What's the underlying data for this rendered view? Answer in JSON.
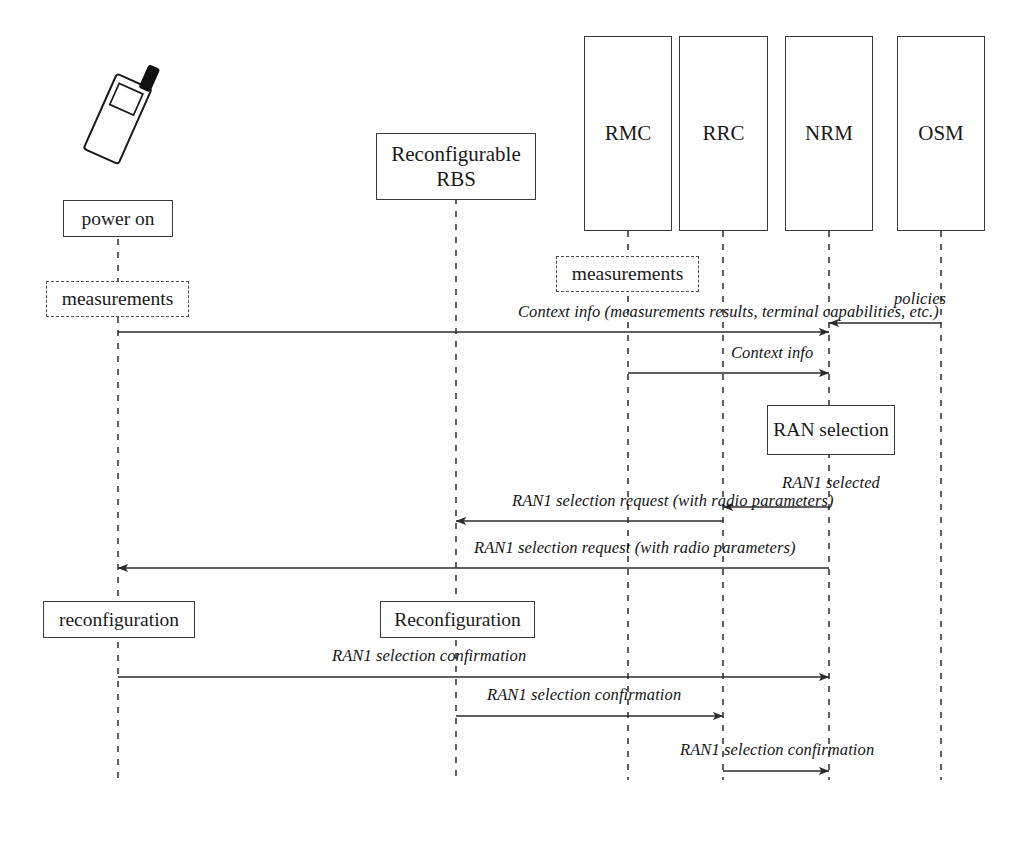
{
  "diagram": {
    "type": "uml-sequence-diagram",
    "title": "",
    "background_color": "#ffffff",
    "line_color": "#3a3a3a",
    "text_color": "#141414"
  },
  "actor_icon": {
    "name": "mobile-handset-icon",
    "label": ""
  },
  "lifelines": [
    {
      "id": "terminal",
      "label": "",
      "has_header_box": false,
      "x": 118,
      "top": 200,
      "bottom": 780
    },
    {
      "id": "rbs",
      "label": "Reconfigurable\nRBS",
      "has_header_box": true,
      "x": 456,
      "top": 133,
      "bottom": 780
    },
    {
      "id": "rmc",
      "label": "RMC",
      "has_header_box": true,
      "x": 628,
      "top": 36,
      "bottom": 780
    },
    {
      "id": "rrc",
      "label": "RRC",
      "has_header_box": true,
      "x": 723,
      "top": 36,
      "bottom": 780
    },
    {
      "id": "nrm",
      "label": "NRM",
      "has_header_box": true,
      "x": 829,
      "top": 36,
      "bottom": 780
    },
    {
      "id": "osm",
      "label": "OSM",
      "has_header_box": true,
      "x": 941,
      "top": 36,
      "bottom": 780
    }
  ],
  "actor_boxes": [
    {
      "id": "rbs-header",
      "line1": "Reconfigurable",
      "line2": "RBS",
      "x": 376,
      "y": 133,
      "w": 160,
      "h": 67
    },
    {
      "id": "rmc-header",
      "line1": "RMC",
      "line2": "",
      "x": 584,
      "y": 36,
      "w": 88,
      "h": 195
    },
    {
      "id": "rrc-header",
      "line1": "RRC",
      "line2": "",
      "x": 679,
      "y": 36,
      "w": 89,
      "h": 195
    },
    {
      "id": "nrm-header",
      "line1": "NRM",
      "line2": "",
      "x": 785,
      "y": 36,
      "w": 88,
      "h": 195
    },
    {
      "id": "osm-header",
      "line1": "OSM",
      "line2": "",
      "x": 897,
      "y": 36,
      "w": 88,
      "h": 195
    }
  ],
  "state_boxes": [
    {
      "id": "power-on",
      "label": "power on",
      "style": "solid",
      "x": 63,
      "y": 200,
      "w": 110,
      "h": 37
    },
    {
      "id": "measurements-term",
      "label": "measurements",
      "style": "dashed",
      "x": 46,
      "y": 281,
      "w": 143,
      "h": 36
    },
    {
      "id": "measurements-rmc",
      "label": "measurements",
      "style": "dashed",
      "x": 556,
      "y": 256,
      "w": 143,
      "h": 36
    },
    {
      "id": "ran-selection",
      "label": "RAN selection",
      "style": "solid",
      "x": 767,
      "y": 405,
      "w": 128,
      "h": 50
    },
    {
      "id": "reconfiguration-term",
      "label": "reconfiguration",
      "style": "solid",
      "x": 43,
      "y": 601,
      "w": 152,
      "h": 37
    },
    {
      "id": "reconfiguration-rbs",
      "label": "Reconfiguration",
      "style": "solid",
      "x": 380,
      "y": 601,
      "w": 155,
      "h": 37
    }
  ],
  "messages": [
    {
      "id": "msg-context-info-full",
      "label": "Context info (measurements results, terminal capabilities, etc.)",
      "from": "terminal",
      "to": "nrm",
      "from_x": 118,
      "to_x": 829,
      "y": 332,
      "direction": "right",
      "label_x": 518,
      "label_y": 322
    },
    {
      "id": "msg-policies",
      "label": "policies",
      "from": "osm",
      "to": "nrm",
      "from_x": 941,
      "to_x": 829,
      "y": 323,
      "direction": "left",
      "label_x": 894,
      "label_y": 309
    },
    {
      "id": "msg-context-info",
      "label": "Context info",
      "from": "rmc",
      "to": "nrm",
      "from_x": 628,
      "to_x": 829,
      "y": 373,
      "direction": "right",
      "label_x": 731,
      "label_y": 363
    },
    {
      "id": "msg-ran1-selected",
      "label": "RAN1 selected",
      "from": "nrm",
      "to": "rrc",
      "from_x": 829,
      "to_x": 723,
      "y": 507,
      "direction": "left",
      "label_x": 782,
      "label_y": 493
    },
    {
      "id": "msg-ran1-sel-req-rbs",
      "label": "RAN1 selection request (with radio parameters)",
      "from": "rrc",
      "to": "rbs",
      "from_x": 723,
      "to_x": 456,
      "y": 521,
      "direction": "left",
      "label_x": 512,
      "label_y": 511
    },
    {
      "id": "msg-ran1-sel-req-term",
      "label": "RAN1 selection request (with radio parameters)",
      "from": "nrm",
      "to": "terminal",
      "from_x": 829,
      "to_x": 118,
      "y": 568,
      "direction": "left",
      "label_x": 474,
      "label_y": 558
    },
    {
      "id": "msg-ran1-conf-nrm",
      "label": "RAN1 selection confirmation",
      "from": "terminal",
      "to": "nrm",
      "from_x": 118,
      "to_x": 829,
      "y": 677,
      "direction": "right",
      "label_x": 332,
      "label_y": 666
    },
    {
      "id": "msg-ran1-conf-rrc",
      "label": "RAN1 selection confirmation",
      "from": "rbs",
      "to": "rrc",
      "from_x": 456,
      "to_x": 723,
      "y": 716,
      "direction": "right",
      "label_x": 487,
      "label_y": 705
    },
    {
      "id": "msg-ran1-conf-nrm2",
      "label": "RAN1 selection confirmation",
      "from": "rrc",
      "to": "nrm",
      "from_x": 723,
      "to_x": 829,
      "y": 771,
      "direction": "right",
      "label_x": 680,
      "label_y": 760
    }
  ]
}
